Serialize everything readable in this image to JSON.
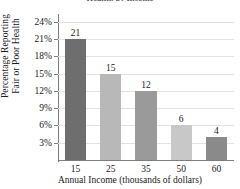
{
  "chart_data": {
    "type": "bar",
    "title": "Health, by Income",
    "xlabel": "Annual Income (thousands of dollars)",
    "ylabel_line1": "Percentage Reporting",
    "ylabel_line2": "Fair or Poor Health",
    "categories": [
      "15",
      "25",
      "35",
      "50",
      "60"
    ],
    "values": [
      21,
      15,
      12,
      6,
      4
    ],
    "value_labels": [
      "21",
      "15",
      "12",
      "6",
      "4"
    ],
    "bar_colors": [
      "#6e6e6e",
      "#b8b8b8",
      "#9a9a9a",
      "#c8c8c8",
      "#8a8a8a"
    ],
    "ylim": [
      0,
      25
    ],
    "yticks": [
      3,
      6,
      9,
      12,
      15,
      18,
      21,
      24
    ],
    "ytick_labels": [
      "3%",
      "6%",
      "9%",
      "12%",
      "15%",
      "18%",
      "21%",
      "24%"
    ],
    "grid": true,
    "legend": "none",
    "axis_color": "#7d7d7d",
    "grid_color": "#e2e2e2"
  }
}
